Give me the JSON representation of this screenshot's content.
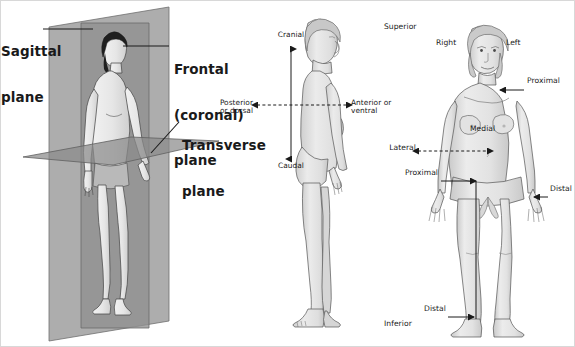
{
  "figure": {
    "background_color": "#ffffff",
    "border_color": "#d8d8d8",
    "ink_color": "#1a1a1a"
  },
  "panel_planes": {
    "name": "Body planes",
    "plane_fill_color": "#9b9b9b",
    "plane_stroke_color": "#6e6e6e",
    "body_fill_color": "#e9e9e9",
    "hair_color": "#1f1f1f",
    "labels": [
      {
        "id": "sagittal",
        "lines": [
          "Sagittal",
          "plane"
        ]
      },
      {
        "id": "frontal",
        "lines": [
          "Frontal",
          "(coronal)",
          "plane"
        ]
      },
      {
        "id": "transverse",
        "lines": [
          "Transverse",
          "plane"
        ]
      }
    ]
  },
  "panel_lateral": {
    "name": "Lateral (side) view",
    "body_fill_color": "#e4e4e4",
    "axis_color": "#1a1a1a",
    "labels": {
      "cranial": "Cranial",
      "caudal": "Caudal",
      "posterior": "Posterior\nor dorsal",
      "anterior": "Anterior or\nventral"
    }
  },
  "panel_anterior": {
    "name": "Anterior (front) view",
    "body_fill_color": "#e4e4e4",
    "axis_color": "#1a1a1a",
    "labels": {
      "superior": "Superior",
      "inferior": "Inferior",
      "right": "Right",
      "left": "Left",
      "medial": "Medial",
      "lateral": "Lateral",
      "proximal_arm": "Proximal",
      "proximal_leg": "Proximal",
      "distal_hand": "Distal",
      "distal_foot": "Distal"
    }
  }
}
